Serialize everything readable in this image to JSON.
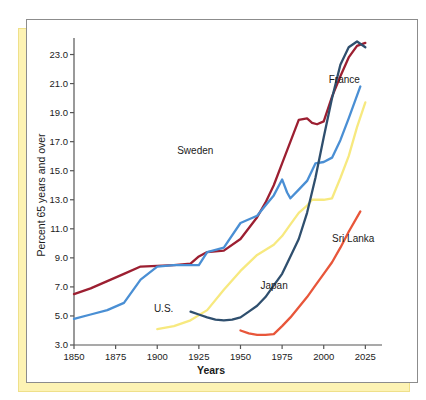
{
  "chart_data": {
    "type": "line",
    "title": "",
    "xlabel": "Years",
    "ylabel": "Percent 65 years and over",
    "xlim": [
      1850,
      2035
    ],
    "ylim": [
      3.0,
      24.0
    ],
    "xticks": [
      1850,
      1875,
      1900,
      1925,
      1950,
      1975,
      2000,
      2025
    ],
    "xticklabels": [
      "1850",
      "1875",
      "1900",
      "1925",
      "1950",
      "1975",
      "2000",
      "2025"
    ],
    "yticks": [
      3.0,
      5.0,
      7.0,
      9.0,
      11.0,
      13.0,
      15.0,
      17.0,
      19.0,
      21.0,
      23.0
    ],
    "yticklabels": [
      "3.0",
      "5.0",
      "7.0",
      "9.0",
      "11.0",
      "13.0",
      "15.0",
      "17.0",
      "19.0",
      "21.0",
      "23.0"
    ],
    "grid": false,
    "legend": "inline-labels",
    "series": [
      {
        "name": "Sweden",
        "color": "#9c1f31",
        "label_x": 1912,
        "label_y": 16.3,
        "points": [
          [
            1850,
            6.5
          ],
          [
            1860,
            6.9
          ],
          [
            1870,
            7.4
          ],
          [
            1880,
            7.9
          ],
          [
            1890,
            8.4
          ],
          [
            1900,
            8.45
          ],
          [
            1910,
            8.5
          ],
          [
            1920,
            8.6
          ],
          [
            1925,
            9.1
          ],
          [
            1930,
            9.4
          ],
          [
            1940,
            9.5
          ],
          [
            1950,
            10.3
          ],
          [
            1960,
            11.8
          ],
          [
            1965,
            12.8
          ],
          [
            1970,
            14.0
          ],
          [
            1975,
            15.5
          ],
          [
            1980,
            17.0
          ],
          [
            1985,
            18.5
          ],
          [
            1990,
            18.6
          ],
          [
            1993,
            18.3
          ],
          [
            1996,
            18.2
          ],
          [
            2000,
            18.4
          ],
          [
            2005,
            20.1
          ],
          [
            2010,
            21.5
          ],
          [
            2015,
            22.8
          ],
          [
            2020,
            23.6
          ],
          [
            2025,
            23.8
          ]
        ]
      },
      {
        "name": "France",
        "color": "#4a8fd4",
        "label_x": 2003,
        "label_y": 21.2,
        "points": [
          [
            1850,
            4.8
          ],
          [
            1860,
            5.1
          ],
          [
            1870,
            5.4
          ],
          [
            1880,
            5.9
          ],
          [
            1890,
            7.5
          ],
          [
            1900,
            8.4
          ],
          [
            1910,
            8.5
          ],
          [
            1920,
            8.5
          ],
          [
            1925,
            8.5
          ],
          [
            1930,
            9.4
          ],
          [
            1940,
            9.7
          ],
          [
            1950,
            11.4
          ],
          [
            1960,
            11.9
          ],
          [
            1965,
            12.6
          ],
          [
            1970,
            13.3
          ],
          [
            1975,
            14.4
          ],
          [
            1978,
            13.5
          ],
          [
            1980,
            13.1
          ],
          [
            1985,
            13.7
          ],
          [
            1990,
            14.3
          ],
          [
            1995,
            15.5
          ],
          [
            2000,
            15.6
          ],
          [
            2005,
            15.9
          ],
          [
            2010,
            17.1
          ],
          [
            2015,
            18.6
          ],
          [
            2022,
            20.8
          ]
        ]
      },
      {
        "name": "U.S.",
        "color": "#f7e97f",
        "label_x": 1898,
        "label_y": 5.4,
        "points": [
          [
            1900,
            4.1
          ],
          [
            1905,
            4.2
          ],
          [
            1910,
            4.3
          ],
          [
            1920,
            4.7
          ],
          [
            1930,
            5.4
          ],
          [
            1940,
            6.8
          ],
          [
            1950,
            8.1
          ],
          [
            1960,
            9.2
          ],
          [
            1970,
            9.9
          ],
          [
            1975,
            10.5
          ],
          [
            1980,
            11.3
          ],
          [
            1985,
            12.1
          ],
          [
            1990,
            12.6
          ],
          [
            1993,
            13.0
          ],
          [
            2000,
            13.0
          ],
          [
            2005,
            13.1
          ],
          [
            2010,
            14.5
          ],
          [
            2015,
            16.0
          ],
          [
            2020,
            18.0
          ],
          [
            2025,
            19.7
          ]
        ]
      },
      {
        "name": "Japan",
        "color": "#2f4f6e",
        "label_x": 1962,
        "label_y": 7.0,
        "points": [
          [
            1920,
            5.3
          ],
          [
            1925,
            5.1
          ],
          [
            1930,
            4.9
          ],
          [
            1935,
            4.75
          ],
          [
            1940,
            4.7
          ],
          [
            1945,
            4.75
          ],
          [
            1950,
            4.9
          ],
          [
            1955,
            5.3
          ],
          [
            1960,
            5.7
          ],
          [
            1965,
            6.3
          ],
          [
            1970,
            7.1
          ],
          [
            1975,
            7.9
          ],
          [
            1980,
            9.1
          ],
          [
            1985,
            10.3
          ],
          [
            1990,
            12.1
          ],
          [
            1995,
            14.5
          ],
          [
            2000,
            17.3
          ],
          [
            2005,
            20.0
          ],
          [
            2010,
            22.3
          ],
          [
            2015,
            23.5
          ],
          [
            2020,
            23.9
          ],
          [
            2025,
            23.5
          ]
        ]
      },
      {
        "name": "Sri Lanka",
        "color": "#e8563a",
        "label_x": 2005,
        "label_y": 10.2,
        "points": [
          [
            1950,
            4.0
          ],
          [
            1955,
            3.8
          ],
          [
            1960,
            3.7
          ],
          [
            1965,
            3.7
          ],
          [
            1970,
            3.75
          ],
          [
            1975,
            4.3
          ],
          [
            1980,
            4.9
          ],
          [
            1985,
            5.6
          ],
          [
            1990,
            6.3
          ],
          [
            1995,
            7.1
          ],
          [
            2000,
            7.9
          ],
          [
            2005,
            8.7
          ],
          [
            2010,
            9.7
          ],
          [
            2015,
            10.8
          ],
          [
            2022,
            12.2
          ]
        ]
      }
    ]
  }
}
